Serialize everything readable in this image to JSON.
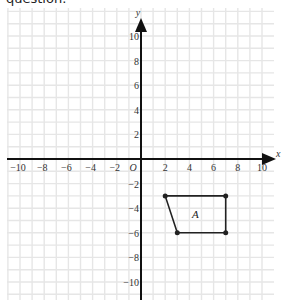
{
  "header": {
    "text": "question."
  },
  "chart_data": {
    "type": "scatter",
    "title": "",
    "xlabel": "x",
    "ylabel": "y",
    "origin_label": "O",
    "xlim": [
      -11,
      11
    ],
    "ylim": [
      -11,
      11
    ],
    "grid": true,
    "x_ticks": [
      -10,
      -8,
      -6,
      -4,
      -2,
      2,
      4,
      6,
      8,
      10
    ],
    "y_ticks": [
      10,
      8,
      6,
      4,
      2,
      -2,
      -4,
      -6,
      -8,
      -10
    ],
    "shapes": [
      {
        "name": "A",
        "vertices": [
          [
            2,
            -3
          ],
          [
            7,
            -3
          ],
          [
            7,
            -6
          ],
          [
            3,
            -6
          ]
        ],
        "label_position": [
          4.5,
          -4.5
        ]
      }
    ],
    "colors": {
      "grid": "#e6e6e6",
      "axis": "#111111",
      "shape": "#222222"
    }
  }
}
